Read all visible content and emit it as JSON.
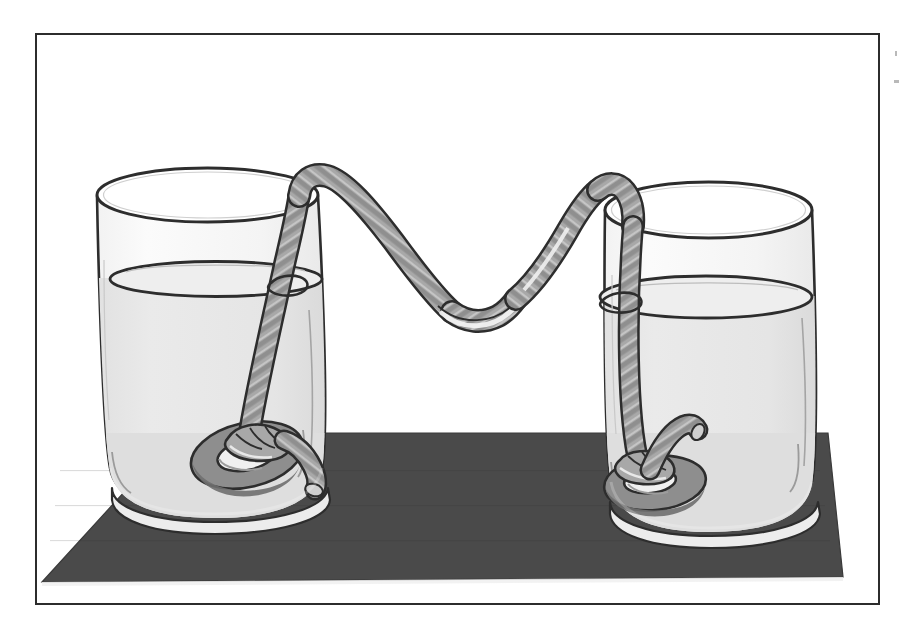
{
  "figure": {
    "title": "Two glasses of water connected by a twisted rope siphon",
    "caption": "",
    "frame": {
      "border_color": "#2c2c2c",
      "background_color": "#ffffff"
    },
    "elements": {
      "board_label": "dark board",
      "left_glass_label": "left glass",
      "right_glass_label": "right glass",
      "rope_label": "twisted rope",
      "left_weight_label": "metal washer weight (left)",
      "right_weight_label": "metal washer weight (right)",
      "left_water_label": "water in left glass",
      "right_water_label": "water in right glass",
      "left_rope_tail_label": "loose rope end (left)",
      "right_rope_tail_label": "loose rope end (right)"
    },
    "colors": {
      "outline": "#2d2d2d",
      "board_fill": "#4a4a4a",
      "glass_fill": "#f7f7f7",
      "water_fill": "#e4e4e4",
      "water_fill_lower": "#dcdcdc",
      "rope_fill": "#a8a8a8",
      "rope_shade": "#8c8c8c",
      "rope_highlight": "#d8d8d8",
      "washer_fill": "#8e8e8e",
      "washer_shade": "#6f6f6f",
      "page_background": "#ffffff"
    },
    "specks": [
      {
        "x": 895,
        "y": 51,
        "w": 2,
        "h": 5
      },
      {
        "x": 894,
        "y": 80,
        "w": 5,
        "h": 3
      }
    ]
  }
}
